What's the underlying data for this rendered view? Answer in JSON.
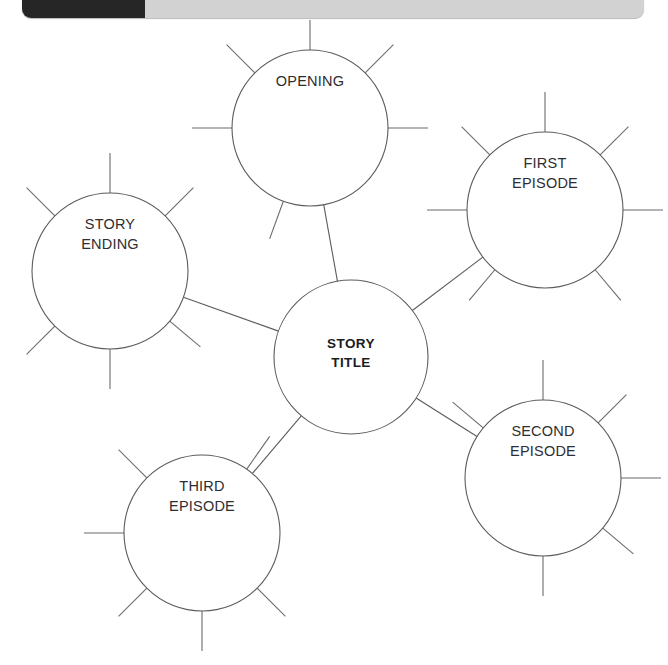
{
  "toolbar": {
    "dark_panel_label": "",
    "title": ""
  },
  "diagram": {
    "type": "mind-map",
    "stroke_color": "#5b5b60",
    "text_color": "#2e2e30",
    "background_color": "#ffffff",
    "center": {
      "id": "story-title",
      "label_lines": [
        "STORY",
        "TITLE"
      ],
      "label": "STORY TITLE",
      "bold": true,
      "cx": 351,
      "cy": 337,
      "r": 77,
      "spokes": []
    },
    "nodes": [
      {
        "id": "opening",
        "label_lines": [
          "OPENING"
        ],
        "label": "OPENING",
        "cx": 310,
        "cy": 108,
        "r": 78,
        "label_dy": -42,
        "spokes": [
          90,
          135,
          45,
          180,
          0,
          250
        ]
      },
      {
        "id": "first-episode",
        "label_lines": [
          "FIRST",
          "EPISODE"
        ],
        "label": "FIRST EPISODE",
        "cx": 545,
        "cy": 190,
        "r": 78,
        "label_dy": -42,
        "spokes": [
          90,
          135,
          45,
          180,
          0,
          230,
          310
        ]
      },
      {
        "id": "story-ending",
        "label_lines": [
          "STORY",
          "ENDING"
        ],
        "label": "STORY ENDING",
        "cx": 110,
        "cy": 251,
        "r": 78,
        "label_dy": -42,
        "spokes": [
          90,
          135,
          45,
          225,
          270,
          320
        ]
      },
      {
        "id": "second-episode",
        "label_lines": [
          "SECOND",
          "EPISODE"
        ],
        "label": "SECOND EPISODE",
        "cx": 543,
        "cy": 458,
        "r": 78,
        "label_dy": -42,
        "spokes": [
          90,
          140,
          45,
          270,
          0,
          320
        ]
      },
      {
        "id": "third-episode",
        "label_lines": [
          "THIRD",
          "EPISODE"
        ],
        "label": "THIRD EPISODE",
        "cx": 202,
        "cy": 513,
        "r": 78,
        "label_dy": -42,
        "spokes": [
          135,
          180,
          225,
          270,
          315,
          55
        ]
      }
    ],
    "links": [
      {
        "from": "story-title",
        "to": "opening"
      },
      {
        "from": "story-title",
        "to": "first-episode"
      },
      {
        "from": "story-title",
        "to": "story-ending"
      },
      {
        "from": "story-title",
        "to": "second-episode"
      },
      {
        "from": "story-title",
        "to": "third-episode"
      }
    ]
  }
}
